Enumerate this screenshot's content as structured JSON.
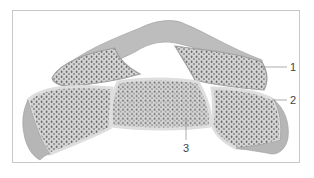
{
  "diagram": {
    "labels": [
      {
        "id": "1",
        "text": "1",
        "x": 290,
        "y": 62
      },
      {
        "id": "2",
        "text": "2",
        "x": 290,
        "y": 95
      },
      {
        "id": "3",
        "text": "3",
        "x": 184,
        "y": 143
      }
    ],
    "colors": {
      "cortical": "#b9b9b9",
      "spongy_fill": "#d9d9d9",
      "pores": "#6a6a6a",
      "cartilage": "#e8e8e8",
      "frame_border": "#c8c8c8",
      "leader_line": "#8a8a8a"
    }
  }
}
